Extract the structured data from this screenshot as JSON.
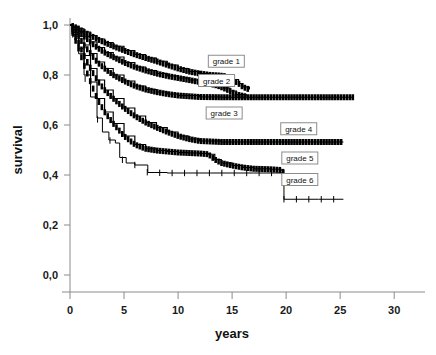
{
  "chart_data": {
    "type": "line",
    "title": "",
    "xlabel": "years",
    "ylabel": "survival",
    "xlim": [
      0,
      31
    ],
    "ylim": [
      0.0,
      1.0
    ],
    "grid": false,
    "legend_position": "inline-callouts",
    "xticks": [
      "0",
      "5",
      "10",
      "15",
      "20",
      "25",
      "30"
    ],
    "xtick_values": [
      0,
      5,
      10,
      15,
      20,
      25,
      30
    ],
    "yticks": [
      "0,0",
      "0,2",
      "0,4",
      "0,6",
      "0,8",
      "1,0"
    ],
    "ytick_values": [
      0.0,
      0.2,
      0.4,
      0.6,
      0.8,
      1.0
    ],
    "decimal_separator": ",",
    "series": [
      {
        "name": "grade 1",
        "label": "grade 1",
        "color": "#000000",
        "style": "step-censored",
        "label_x": 12.8,
        "label_y": 0.855,
        "end_x": 16.6,
        "plateau": 0.8,
        "x": [
          0,
          0.3,
          0.8,
          1.3,
          1.9,
          2.5,
          3.2,
          4.0,
          5.0,
          6.0,
          7.0,
          8.0,
          9.0,
          10.0,
          11.0,
          12.0,
          13.0,
          13.8,
          14.4,
          15.0,
          15.6,
          16.0,
          16.6
        ],
        "y": [
          1.0,
          0.995,
          0.985,
          0.972,
          0.958,
          0.944,
          0.93,
          0.915,
          0.898,
          0.882,
          0.868,
          0.855,
          0.84,
          0.826,
          0.814,
          0.806,
          0.8,
          0.798,
          0.795,
          0.782,
          0.766,
          0.752,
          0.742
        ]
      },
      {
        "name": "grade 2",
        "label": "grade 2",
        "color": "#000000",
        "style": "step-censored",
        "label_x": 11.9,
        "label_y": 0.778,
        "end_x": 16.3,
        "plateau": 0.755,
        "x": [
          0,
          0.3,
          0.8,
          1.3,
          1.9,
          2.5,
          3.2,
          4.0,
          5.0,
          6.0,
          7.0,
          8.0,
          9.0,
          10.0,
          11.0,
          12.0,
          13.0,
          13.6,
          14.2,
          14.8,
          15.4,
          16.3
        ],
        "y": [
          1.0,
          0.99,
          0.975,
          0.955,
          0.932,
          0.91,
          0.89,
          0.872,
          0.85,
          0.832,
          0.818,
          0.806,
          0.796,
          0.788,
          0.78,
          0.772,
          0.764,
          0.758,
          0.748,
          0.736,
          0.722,
          0.714
        ]
      },
      {
        "name": "grade 3",
        "label": "grade 3",
        "color": "#000000",
        "style": "step-censored",
        "label_x": 12.6,
        "label_y": 0.648,
        "end_x": 26.2,
        "plateau": 0.71,
        "x": [
          0,
          0.3,
          0.8,
          1.3,
          1.9,
          2.5,
          3.2,
          4.0,
          5.0,
          6.0,
          7.0,
          8.0,
          9.0,
          10.0,
          12.0,
          14.0,
          16.0,
          18.0,
          20.0,
          22.0,
          24.0,
          26.2
        ],
        "y": [
          1.0,
          0.982,
          0.955,
          0.92,
          0.886,
          0.852,
          0.826,
          0.8,
          0.776,
          0.756,
          0.742,
          0.732,
          0.724,
          0.718,
          0.712,
          0.711,
          0.711,
          0.711,
          0.711,
          0.711,
          0.711,
          0.711
        ]
      },
      {
        "name": "grade 4",
        "label": "grade 4",
        "color": "#000000",
        "style": "step-censored",
        "label_x": 19.5,
        "label_y": 0.585,
        "end_x": 25.3,
        "plateau": 0.532,
        "x": [
          0,
          0.3,
          0.8,
          1.3,
          1.9,
          2.5,
          3.2,
          4.0,
          5.0,
          6.0,
          7.0,
          8.0,
          9.0,
          10.0,
          11.0,
          12.0,
          14.0,
          16.0,
          18.0,
          20.0,
          22.0,
          25.3
        ],
        "y": [
          1.0,
          0.97,
          0.928,
          0.878,
          0.826,
          0.78,
          0.74,
          0.706,
          0.668,
          0.636,
          0.61,
          0.59,
          0.572,
          0.556,
          0.544,
          0.536,
          0.532,
          0.532,
          0.532,
          0.532,
          0.532,
          0.532
        ]
      },
      {
        "name": "grade 5",
        "label": "grade 5",
        "color": "#000000",
        "style": "step-censored",
        "label_x": 19.6,
        "label_y": 0.468,
        "end_x": 19.8,
        "plateau": 0.425,
        "x": [
          0,
          0.3,
          0.8,
          1.3,
          1.9,
          2.5,
          3.2,
          4.0,
          5.0,
          6.0,
          7.0,
          8.0,
          9.0,
          10.0,
          11.0,
          12.0,
          12.8,
          13.4,
          14.0,
          15.0,
          16.0,
          17.0,
          18.5,
          19.5,
          19.8
        ],
        "y": [
          1.0,
          0.962,
          0.905,
          0.84,
          0.772,
          0.706,
          0.652,
          0.606,
          0.556,
          0.522,
          0.505,
          0.498,
          0.494,
          0.49,
          0.488,
          0.486,
          0.483,
          0.462,
          0.448,
          0.438,
          0.43,
          0.425,
          0.423,
          0.42,
          0.408
        ]
      },
      {
        "name": "grade 6",
        "label": "grade 6",
        "color": "#000000",
        "style": "step-thin",
        "label_x": 19.6,
        "label_y": 0.382,
        "end_x": 25.3,
        "plateau": 0.303,
        "x": [
          0,
          0.3,
          0.8,
          1.3,
          1.9,
          2.5,
          3.0,
          3.6,
          4.2,
          4.6,
          5.2,
          6.0,
          7.2,
          9.0,
          11.0,
          13.0,
          15.0,
          17.0,
          19.0,
          19.8,
          21.0,
          23.0,
          25.3
        ],
        "y": [
          1.0,
          0.955,
          0.885,
          0.8,
          0.712,
          0.628,
          0.572,
          0.54,
          0.528,
          0.47,
          0.448,
          0.44,
          0.41,
          0.408,
          0.408,
          0.408,
          0.408,
          0.408,
          0.408,
          0.303,
          0.303,
          0.303,
          0.303
        ]
      }
    ]
  }
}
